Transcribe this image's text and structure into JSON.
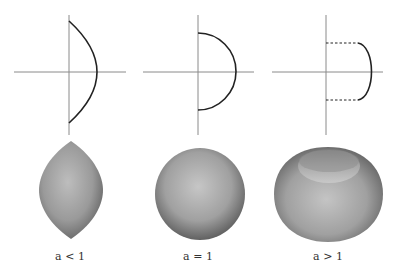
{
  "figure": {
    "panels": [
      {
        "id": "a-less-than-1",
        "label": "a < 1",
        "label_var": "a",
        "label_rel": "< 1",
        "profile": "circular arc crossing y-axis at endpoints (lens / lemon profile)",
        "surface": "lemon (spindle torus)"
      },
      {
        "id": "a-equals-1",
        "label": "a = 1",
        "label_var": "a",
        "label_rel": "= 1",
        "profile": "semicircle with endpoints on y-axis",
        "surface": "sphere"
      },
      {
        "id": "a-greater-than-1",
        "label": "a > 1",
        "label_var": "a",
        "label_rel": "> 1",
        "profile": "circular arc offset from y-axis with dashed connectors",
        "surface": "apple (horn-like torus with dimple)"
      }
    ],
    "colors": {
      "axis": "#8a8a8a",
      "curve": "#222222",
      "surface_light": "#c8c8c8",
      "surface_dark": "#5a5a5a",
      "background": "#ffffff"
    }
  }
}
